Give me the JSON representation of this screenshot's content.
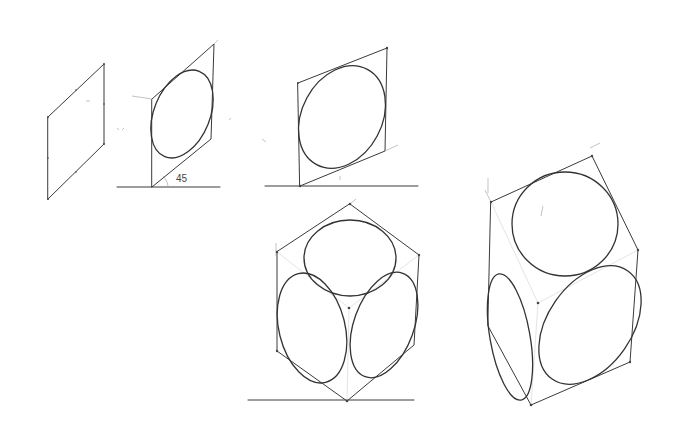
{
  "canvas": {
    "width": 680,
    "height": 440,
    "background": "#ffffff",
    "stroke": "#3a3a3a"
  },
  "sketch": {
    "subject": "Pencil construction of ellipses inscribed in parallelograms and two isometric cubes with circles on each face",
    "panels": [
      {
        "id": "parallelogram",
        "description": "Empty oblique parallelogram (vertical sides)"
      },
      {
        "id": "parallelogram-ellipse-45",
        "description": "Parallelogram with inscribed ellipse on baseline",
        "angle_label": "45"
      },
      {
        "id": "parallelogram-ellipse-shallow",
        "description": "Shallower parallelogram with inscribed ellipse on baseline"
      },
      {
        "id": "isometric-cube",
        "description": "Isometric cube with ellipses on three faces, on baseline"
      },
      {
        "id": "rotated-cube",
        "description": "Rotated cube with circle on top face and ellipses on two side faces"
      }
    ],
    "annotations": {
      "angle_label": "45"
    }
  }
}
